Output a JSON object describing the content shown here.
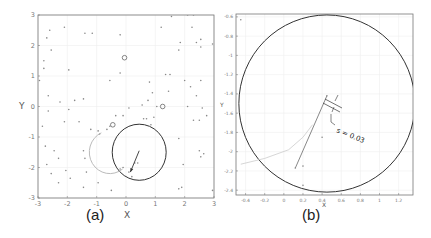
{
  "chart_data": [
    {
      "id": "a",
      "type": "scatter",
      "panel_label": "(a)",
      "title": "",
      "xlabel": "X",
      "ylabel": "Y",
      "xlim": [
        -3,
        3
      ],
      "ylim": [
        -3,
        3
      ],
      "xticks": [
        "-3",
        "-2",
        "-1",
        "0",
        "1",
        "2",
        "3"
      ],
      "yticks": [
        "-3",
        "-2",
        "-1",
        "0",
        "1",
        "2",
        "3"
      ],
      "grid": true,
      "frame_px": {
        "x0": 38,
        "x1": 214,
        "y0": 15,
        "y1": 198
      },
      "series": [
        {
          "name": "random points",
          "marker": "dot",
          "points": [
            [
              -2.6,
              2.5
            ],
            [
              -2.1,
              2.6
            ],
            [
              -1.4,
              2.4
            ],
            [
              -1.15,
              2.4
            ],
            [
              -0.2,
              2.35
            ],
            [
              1.2,
              2.6
            ],
            [
              2.25,
              2.6
            ],
            [
              2.3,
              3.0
            ],
            [
              2.1,
              3.0
            ],
            [
              1.55,
              2.95
            ],
            [
              -2.7,
              2.25
            ],
            [
              -2.55,
              1.85
            ],
            [
              -2.8,
              1.5
            ],
            [
              -2.8,
              1.25
            ],
            [
              -1.95,
              1.2
            ],
            [
              -0.2,
              1.1
            ],
            [
              -0.55,
              0.85
            ],
            [
              0.8,
              0.8
            ],
            [
              1.35,
              1.05
            ],
            [
              1.5,
              1.05
            ],
            [
              -2.95,
              0.85
            ],
            [
              -2.65,
              0.35
            ],
            [
              -2.25,
              0.15
            ],
            [
              -1.75,
              0.2
            ],
            [
              -1.45,
              0.25
            ],
            [
              -2.65,
              -0.15
            ],
            [
              -1.95,
              -0.1
            ],
            [
              -0.35,
              -0.3
            ],
            [
              -0.1,
              -0.3
            ],
            [
              0.1,
              -0.05
            ],
            [
              0.55,
              0.05
            ],
            [
              0.75,
              0.2
            ],
            [
              0.9,
              0.45
            ],
            [
              1.05,
              0.0
            ],
            [
              1.45,
              0.5
            ],
            [
              1.85,
              2.1
            ],
            [
              1.8,
              1.85
            ],
            [
              2.4,
              2.1
            ],
            [
              2.55,
              2.2
            ],
            [
              2.55,
              1.95
            ],
            [
              2.0,
              0.85
            ],
            [
              2.2,
              0.65
            ],
            [
              2.55,
              0.85
            ],
            [
              2.4,
              0.35
            ],
            [
              2.1,
              0.0
            ],
            [
              2.6,
              -0.05
            ],
            [
              2.75,
              -0.3
            ],
            [
              2.5,
              -0.45
            ],
            [
              2.95,
              2.05
            ],
            [
              -2.85,
              -0.65
            ],
            [
              -2.1,
              -0.5
            ],
            [
              -1.6,
              -0.5
            ],
            [
              -1.2,
              -0.75
            ],
            [
              -0.95,
              -0.8
            ],
            [
              -0.9,
              -0.9
            ],
            [
              -0.65,
              -0.75
            ],
            [
              -0.55,
              -0.65
            ],
            [
              0.6,
              -0.4
            ],
            [
              0.7,
              -0.4
            ],
            [
              0.95,
              -0.35
            ],
            [
              0.85,
              -0.6
            ],
            [
              -2.75,
              -1.3
            ],
            [
              -2.45,
              -1.45
            ],
            [
              -2.3,
              -1.7
            ],
            [
              -1.45,
              -1.45
            ],
            [
              -1.4,
              -1.7
            ],
            [
              -2.7,
              -1.9
            ],
            [
              -2.55,
              -2.2
            ],
            [
              -2.05,
              -2.1
            ],
            [
              -1.9,
              -2.35
            ],
            [
              -2.3,
              -2.5
            ],
            [
              -1.35,
              -2.15
            ],
            [
              -0.95,
              -2.5
            ],
            [
              -1.45,
              -2.65
            ],
            [
              -0.5,
              -2.75
            ],
            [
              1.8,
              -1.05
            ],
            [
              2.5,
              -1.45
            ],
            [
              2.65,
              -1.55
            ],
            [
              2.55,
              -1.65
            ],
            [
              1.95,
              -1.9
            ],
            [
              1.8,
              -2.7
            ],
            [
              1.9,
              -2.65
            ],
            [
              2.95,
              -2.75
            ],
            [
              2.3,
              -0.45
            ],
            [
              -0.1,
              -2.0
            ],
            [
              0.2,
              -2.3
            ],
            [
              0.1,
              -2.15
            ],
            [
              0.3,
              -1.85
            ],
            [
              0.4,
              -1.85
            ],
            [
              -0.2,
              -2.05
            ]
          ]
        },
        {
          "name": "obstacles",
          "marker": "open-circle",
          "points": [
            [
              -0.05,
              1.6
            ],
            [
              1.25,
              0.0
            ],
            [
              -0.45,
              -0.6
            ]
          ]
        },
        {
          "name": "sensing circle",
          "shape": "circle",
          "center": [
            0.45,
            -1.5
          ],
          "radius": 0.92,
          "color": "#333333"
        },
        {
          "name": "previous path (gray arc)",
          "shape": "arc",
          "center": [
            -0.55,
            -1.5
          ],
          "radius": 0.7,
          "color": "#bbbbbb"
        },
        {
          "name": "motion vector",
          "shape": "arrow",
          "from": [
            0.45,
            -1.45
          ],
          "to": [
            0.15,
            -2.15
          ],
          "color": "#333333"
        }
      ]
    },
    {
      "id": "b",
      "type": "scatter",
      "panel_label": "(b)",
      "title": "",
      "xlabel": "X",
      "ylabel": "Y",
      "xlim": [
        -0.5,
        1.35
      ],
      "ylim": [
        -2.45,
        -0.57
      ],
      "xticks": [
        "-0.4",
        "-0.2",
        "0",
        "0.2",
        "0.4",
        "0.6",
        "0.8",
        "1",
        "1.2"
      ],
      "yticks": [
        "-0.6",
        "-0.8",
        "-1",
        "-1.2",
        "-1.4",
        "-1.6",
        "-1.8",
        "-2",
        "-2.2",
        "-2.4"
      ],
      "grid": true,
      "frame_px": {
        "x0": 236,
        "x1": 413,
        "y0": 14,
        "y1": 195
      },
      "annotation": "s = 0.03",
      "series": [
        {
          "name": "sensing circle (zoomed)",
          "shape": "circle",
          "center": [
            0.45,
            -1.5
          ],
          "radius": 0.92,
          "color": "#333333"
        },
        {
          "name": "trajectory",
          "shape": "line",
          "from": [
            0.12,
            -2.17
          ],
          "to": [
            0.45,
            -1.42
          ],
          "color": "#555555"
        },
        {
          "name": "previous path (gray arc)",
          "shape": "arc",
          "points": [
            [
              -0.45,
              -2.13
            ],
            [
              -0.2,
              -2.07
            ],
            [
              0.05,
              -1.98
            ],
            [
              0.2,
              -1.85
            ],
            [
              0.3,
              -1.72
            ]
          ],
          "color": "#cccccc"
        },
        {
          "name": "nearby points",
          "marker": "dot",
          "points": [
            [
              0.12,
              -2.17
            ],
            [
              0.2,
              -2.15
            ],
            [
              0.4,
              -1.85
            ],
            [
              0.45,
              -1.42
            ],
            [
              0.2,
              -2.35
            ],
            [
              -0.45,
              -0.63
            ]
          ]
        }
      ]
    }
  ]
}
